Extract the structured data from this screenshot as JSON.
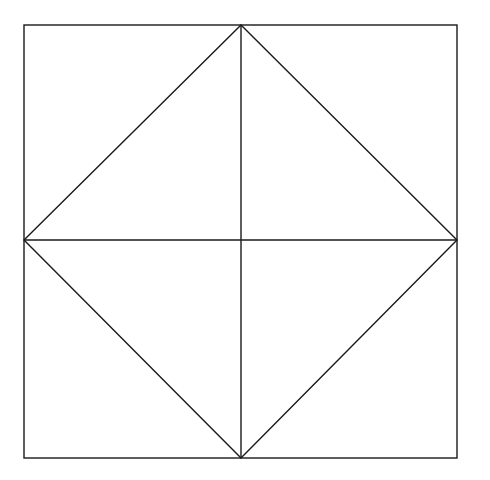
{
  "diagram": {
    "canvas": {
      "width": 490,
      "height": 480,
      "background": "#ffffff"
    },
    "stroke": {
      "color": "#1a1a1a",
      "width": 1.4
    },
    "square": {
      "x1": 24,
      "y1": 25,
      "x2": 457,
      "y2": 458
    },
    "center": {
      "x": 241,
      "y": 240
    },
    "diamond_vertices": [
      {
        "x": 241,
        "y": 25
      },
      {
        "x": 457,
        "y": 240
      },
      {
        "x": 241,
        "y": 458
      },
      {
        "x": 24,
        "y": 240
      }
    ],
    "midlines": [
      {
        "name": "vertical",
        "x1": 241,
        "y1": 25,
        "x2": 241,
        "y2": 458
      },
      {
        "name": "horizontal",
        "x1": 24,
        "y1": 240,
        "x2": 457,
        "y2": 240
      }
    ]
  }
}
